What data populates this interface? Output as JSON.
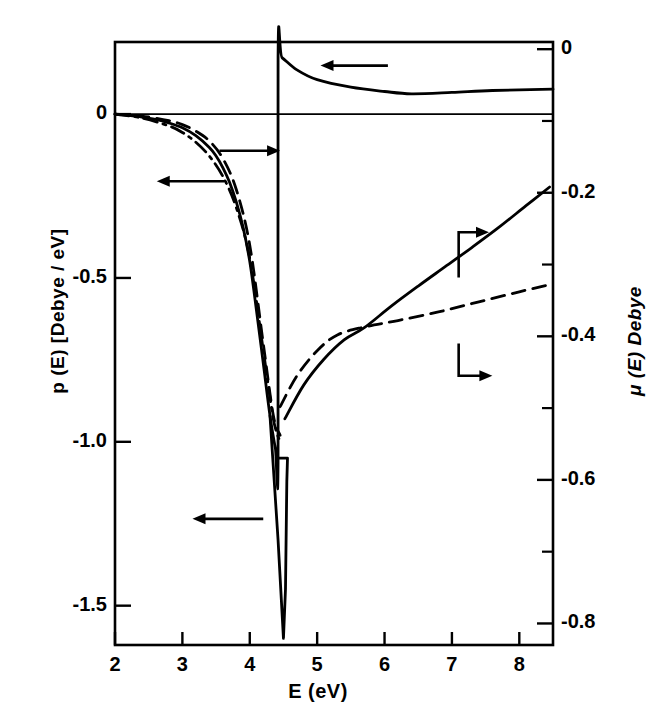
{
  "chart_data": {
    "type": "line",
    "title": "",
    "xlabel": "E (eV)",
    "ylabel": "p (E)  [Debye / eV]",
    "y2label": "μ (E) Debye",
    "xlim": [
      2,
      8.5
    ],
    "ylim": [
      -1.62,
      0.22
    ],
    "y2lim": [
      -0.83,
      0.01
    ],
    "grid": false,
    "legend_position": "none",
    "xticks": [
      2,
      3,
      4,
      5,
      6,
      7,
      8
    ],
    "xticklabels": [
      "2",
      "3",
      "4",
      "5",
      "6",
      "7",
      "8"
    ],
    "yticks": [
      0,
      -0.5,
      -1.0,
      -1.5
    ],
    "yticklabels": [
      "0",
      "-0.5",
      "-1.0",
      "-1.5"
    ],
    "y2ticks": [
      0,
      -0.2,
      -0.4,
      -0.6,
      -0.8
    ],
    "y2ticklabels": [
      "0",
      "-0.2",
      "-0.4",
      "-0.6",
      "-0.8"
    ],
    "y2minorticks": [
      -0.1,
      -0.3,
      -0.5,
      -0.7
    ],
    "series": [
      {
        "name": "p(E) solid",
        "axis": "left",
        "style": "solid",
        "points": [
          [
            2.0,
            0.0
          ],
          [
            2.2,
            -0.004
          ],
          [
            2.4,
            -0.009
          ],
          [
            2.6,
            -0.016
          ],
          [
            2.8,
            -0.027
          ],
          [
            3.0,
            -0.042
          ],
          [
            3.2,
            -0.066
          ],
          [
            3.4,
            -0.102
          ],
          [
            3.5,
            -0.128
          ],
          [
            3.6,
            -0.163
          ],
          [
            3.7,
            -0.208
          ],
          [
            3.8,
            -0.268
          ],
          [
            3.9,
            -0.345
          ],
          [
            4.0,
            -0.45
          ],
          [
            4.1,
            -0.6
          ],
          [
            4.2,
            -0.76
          ],
          [
            4.3,
            -0.92
          ],
          [
            4.38,
            -1.02
          ],
          [
            4.42,
            -1.06
          ],
          [
            4.42,
            0.175
          ],
          [
            4.48,
            0.172
          ],
          [
            4.7,
            0.135
          ],
          [
            5.0,
            0.105
          ],
          [
            5.5,
            0.082
          ],
          [
            6.0,
            0.069
          ],
          [
            6.4,
            0.062
          ],
          [
            7.0,
            0.066
          ],
          [
            7.6,
            0.072
          ],
          [
            8.5,
            0.076
          ]
        ]
      },
      {
        "name": "p(E) spike",
        "axis": "left",
        "style": "solid",
        "points": [
          [
            4.3,
            -0.92
          ],
          [
            4.42,
            -1.3
          ],
          [
            4.5,
            -1.6
          ],
          [
            4.53,
            -1.45
          ],
          [
            4.55,
            -1.12
          ],
          [
            4.56,
            -1.05
          ],
          [
            4.5,
            -1.05
          ],
          [
            4.44,
            -1.05
          ]
        ]
      },
      {
        "name": "p(E) dashed",
        "axis": "left",
        "style": "dashed",
        "points": [
          [
            2.0,
            0.0
          ],
          [
            2.4,
            -0.006
          ],
          [
            2.8,
            -0.02
          ],
          [
            3.0,
            -0.032
          ],
          [
            3.2,
            -0.052
          ],
          [
            3.4,
            -0.082
          ],
          [
            3.6,
            -0.135
          ],
          [
            3.8,
            -0.23
          ],
          [
            4.0,
            -0.4
          ],
          [
            4.2,
            -0.7
          ],
          [
            4.35,
            -0.92
          ],
          [
            4.45,
            -0.98
          ]
        ]
      },
      {
        "name": "p(E) dash-dot",
        "axis": "left",
        "style": "dashdot",
        "points": [
          [
            2.0,
            0.0
          ],
          [
            2.4,
            -0.012
          ],
          [
            2.8,
            -0.036
          ],
          [
            3.0,
            -0.056
          ],
          [
            3.2,
            -0.086
          ],
          [
            3.4,
            -0.128
          ],
          [
            3.6,
            -0.19
          ],
          [
            3.8,
            -0.285
          ],
          [
            4.0,
            -0.44
          ],
          [
            4.2,
            -0.72
          ],
          [
            4.35,
            -0.93
          ],
          [
            4.45,
            -1.0
          ]
        ]
      },
      {
        "name": "μ(E) solid",
        "axis": "right",
        "style": "solid",
        "points": [
          [
            4.52,
            -0.515
          ],
          [
            4.8,
            -0.468
          ],
          [
            5.1,
            -0.432
          ],
          [
            5.4,
            -0.405
          ],
          [
            5.7,
            -0.388
          ],
          [
            6.1,
            -0.358
          ],
          [
            6.5,
            -0.33
          ],
          [
            6.9,
            -0.303
          ],
          [
            7.3,
            -0.276
          ],
          [
            7.7,
            -0.248
          ],
          [
            8.1,
            -0.218
          ],
          [
            8.45,
            -0.192
          ]
        ]
      },
      {
        "name": "μ(E) dashed",
        "axis": "right",
        "style": "dashed",
        "points": [
          [
            4.45,
            -0.498
          ],
          [
            4.7,
            -0.455
          ],
          [
            5.0,
            -0.42
          ],
          [
            5.3,
            -0.398
          ],
          [
            5.7,
            -0.387
          ],
          [
            6.2,
            -0.378
          ],
          [
            6.8,
            -0.366
          ],
          [
            7.4,
            -0.352
          ],
          [
            8.0,
            -0.338
          ],
          [
            8.45,
            -0.328
          ]
        ]
      }
    ],
    "annotations": [
      {
        "name": "arrow-left-top",
        "direction": "left",
        "x1": 6.05,
        "y1": 0.148,
        "x2": 5.05,
        "y2": 0.148
      },
      {
        "name": "arrow-right-upper",
        "direction": "right",
        "x1": 3.55,
        "y1": -0.112,
        "x2": 4.45,
        "y2": -0.112
      },
      {
        "name": "arrow-left-upper",
        "direction": "left",
        "x1": 3.62,
        "y1": -0.205,
        "x2": 2.62,
        "y2": -0.205
      },
      {
        "name": "arrow-left-lower",
        "direction": "left",
        "x1": 4.2,
        "y1": -1.235,
        "x2": 3.15,
        "y2": -1.235
      },
      {
        "name": "arrow-right-mu-upper",
        "direction": "right",
        "elbow": true,
        "x1": 7.1,
        "y1_right": -0.318,
        "x2": 7.55,
        "y2_right": -0.255
      },
      {
        "name": "arrow-right-mu-lower",
        "direction": "right",
        "elbow": true,
        "x1": 7.1,
        "y1_right": -0.41,
        "x2": 7.6,
        "y2_right": -0.455
      }
    ]
  },
  "axes": {
    "x_title": "E (eV)",
    "y_left_title": "p (E)  [Debye / eV]",
    "y_right_title": "μ (E) Debye"
  },
  "colors": {
    "ink": "#000000",
    "background": "#ffffff"
  }
}
